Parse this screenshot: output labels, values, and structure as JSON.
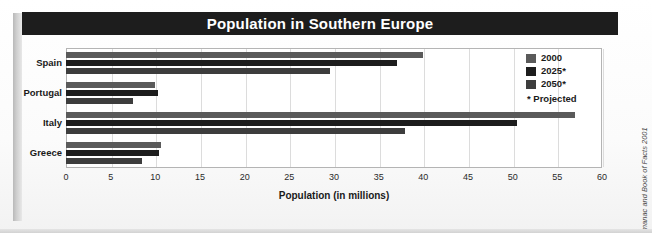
{
  "figure": {
    "title": "Population in Southern Europe",
    "source": "Source: The World Almanac and Book of Facts 2001",
    "title_bar_color": "#1d1d1d",
    "frame_color": "#b4b4b4",
    "grid_color": "#dcdcdc",
    "plot_background": "#ffffff"
  },
  "legend": {
    "position": "top-right-inside",
    "entries": [
      {
        "label": "2000",
        "color": "#5a5a5a"
      },
      {
        "label": "2025*",
        "color": "#1d1d1d"
      },
      {
        "label": "2050*",
        "color": "#3d3d3d"
      }
    ],
    "note": "* Projected"
  },
  "chart_data": {
    "type": "bar",
    "orientation": "horizontal",
    "title": "Population in Southern Europe",
    "xlabel": "Population (in millions)",
    "ylabel": "",
    "categories": [
      "Spain",
      "Portugal",
      "Italy",
      "Greece"
    ],
    "series": [
      {
        "name": "2000",
        "color": "#5a5a5a",
        "values": [
          40.0,
          10.0,
          57.0,
          10.6
        ]
      },
      {
        "name": "2025*",
        "color": "#1d1d1d",
        "values": [
          37.0,
          10.3,
          50.5,
          10.4
        ]
      },
      {
        "name": "2050*",
        "color": "#3d3d3d",
        "values": [
          29.5,
          7.5,
          38.0,
          8.5
        ]
      }
    ],
    "xlim": [
      0,
      60
    ],
    "xticks": [
      0,
      5,
      10,
      15,
      20,
      25,
      30,
      35,
      40,
      45,
      50,
      55,
      60
    ],
    "xtick_labels": [
      "0",
      "5",
      "10",
      "15",
      "20",
      "25",
      "30",
      "35",
      "40",
      "45",
      "50",
      "55",
      "60"
    ],
    "grid": "vertical",
    "legend_entries": [
      "2000",
      "2025*",
      "2050*"
    ],
    "annotations": [
      "* Projected"
    ]
  }
}
